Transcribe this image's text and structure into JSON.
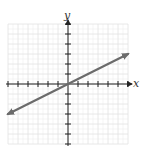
{
  "chart_data": {
    "type": "line",
    "title": "",
    "xlabel": "x",
    "ylabel": "y",
    "xlim": [
      -6,
      6
    ],
    "ylim": [
      -6,
      6
    ],
    "grid": true,
    "x_ticks": [
      -6,
      -5,
      -4,
      -3,
      -2,
      -1,
      1,
      2,
      3,
      4,
      5,
      6
    ],
    "y_ticks": [
      -6,
      -5,
      -4,
      -3,
      -2,
      -1,
      1,
      2,
      3,
      4,
      5,
      6
    ],
    "series": [
      {
        "name": "line",
        "equation": "y = 0.5x",
        "x": [
          -6,
          6
        ],
        "y": [
          -3,
          3
        ],
        "arrows_both_ends": true,
        "color": "#6b6b6b"
      }
    ]
  },
  "colors": {
    "grid": "#e2e2e2",
    "axis": "#222222",
    "line": "#6b6b6b"
  }
}
